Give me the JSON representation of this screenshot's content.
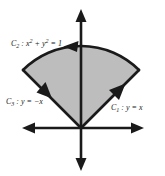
{
  "figure": {
    "background_color": "#ffffff",
    "stroke_color": "#1a1a1a",
    "region_fill_color": "#bdbdbd",
    "region_edge_color": "#1a1a1a",
    "width": 165,
    "height": 176
  },
  "axes": {
    "origin": {
      "x": 81,
      "y": 128
    },
    "x_axis": {
      "name": "horizontal-axis",
      "start_x": 25,
      "end_x": 141,
      "y": 128,
      "double_headed": true
    },
    "y_axis": {
      "name": "vertical-axis",
      "x": 81,
      "start_y": 11,
      "end_y": 169,
      "double_headed": true
    }
  },
  "region": {
    "name": "shaded-sector",
    "description": "Circular sector of the unit disk between the lines y = -x and y = x, above both lines",
    "center": {
      "x": 81,
      "y": 128
    },
    "radius": 82,
    "start_angle_deg": 45,
    "end_angle_deg": 135,
    "fill": "#bdbdbd"
  },
  "curves": [
    {
      "id": "C1",
      "name": "curve-c1-line-y-equals-x",
      "label": "C",
      "subscript": "1",
      "separator": " : ",
      "equation_prefix": "y = ",
      "equation_body": "x",
      "full_label": "C₁ : y = x",
      "orientation": "outward from origin, up and to the right",
      "from": {
        "x": 81,
        "y": 128
      },
      "to": {
        "x": 139,
        "y": 70
      },
      "arrow_at": "end"
    },
    {
      "id": "C2",
      "name": "curve-c2-unit-circle-arc",
      "label": "C",
      "subscript": "2",
      "separator": " : ",
      "equation_prefix": "",
      "equation_body": "x² + y² = 1",
      "full_label": "C₂ : x² + y² = 1",
      "orientation": "counterclockwise, from the right end of the arc to the left end",
      "from": {
        "x": 139,
        "y": 70
      },
      "to": {
        "x": 23,
        "y": 70
      },
      "arrow_at": "end"
    },
    {
      "id": "C3",
      "name": "curve-c3-line-y-equals-minus-x",
      "label": "C",
      "subscript": "3",
      "separator": " : ",
      "equation_prefix": "y = ",
      "equation_body": "−x",
      "full_label": "C₃ : y = −x",
      "orientation": "inward toward the origin, down and to the right",
      "from": {
        "x": 23,
        "y": 70
      },
      "to": {
        "x": 81,
        "y": 128
      },
      "arrow_at": "midpoint"
    }
  ],
  "labels": {
    "c2": {
      "name": "label-c2",
      "letter": "C",
      "subscript": "2",
      "colon": " : ",
      "x_term": "x",
      "x_power": "2",
      "plus": " + ",
      "y_term": "y",
      "y_power": "2",
      "equals": " = 1"
    },
    "c3": {
      "name": "label-c3",
      "letter": "C",
      "subscript": "3",
      "colon": " : ",
      "body": "y = −x"
    },
    "c1": {
      "name": "label-c1",
      "letter": "C",
      "subscript": "1",
      "colon": " : ",
      "body": "y = x"
    }
  }
}
